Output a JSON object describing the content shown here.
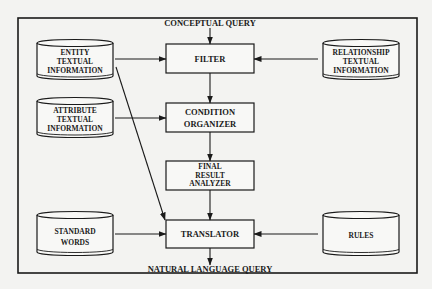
{
  "diagram": {
    "input_label": "CONCEPTUAL QUERY",
    "output_label": "NATURAL LANGUAGE QUERY",
    "process_boxes": {
      "filter": [
        "FILTER"
      ],
      "condition_organizer": [
        "CONDITION",
        "ORGANIZER"
      ],
      "final_result_analyzer": [
        "FINAL",
        "RESULT",
        "ANALYZER"
      ],
      "translator": [
        "TRANSLATOR"
      ]
    },
    "data_stores": {
      "entity": [
        "ENTITY",
        "TEXTUAL",
        "INFORMATION"
      ],
      "attribute": [
        "ATTRIBUTE",
        "TEXTUAL",
        "INFORMATION"
      ],
      "standard_words": [
        "STANDARD",
        "WORDS"
      ],
      "relationship": [
        "RELATIONSHIP",
        "TEXTUAL",
        "INFORMATION"
      ],
      "rules": [
        "RULES"
      ]
    },
    "colors": {
      "background": "#f3f3f1",
      "stroke": "#1a1a1a",
      "fill": "#f8f8f6"
    }
  }
}
